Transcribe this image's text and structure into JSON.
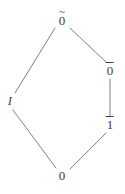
{
  "figure": {
    "kind": "hasse-diagram",
    "background_color": "#ffffff",
    "line_color": "#808080",
    "text_color": "#3d3d3d",
    "width": 125,
    "height": 194
  },
  "nodes": [
    {
      "id": "zero-tilde",
      "label": "0",
      "accent": "tilde",
      "accent_glyph": "~",
      "display": "0̃",
      "style": "roman",
      "x": 62,
      "y": 20
    },
    {
      "id": "zero-bar",
      "label": "0",
      "accent": "overline",
      "accent_glyph": "¯",
      "display": "0̄",
      "style": "roman",
      "x": 110,
      "y": 70
    },
    {
      "id": "i-node",
      "label": "I",
      "accent": "none",
      "accent_glyph": "",
      "display": "I",
      "style": "italic",
      "x": 10,
      "y": 101
    },
    {
      "id": "one-bar",
      "label": "1",
      "accent": "overline",
      "accent_glyph": "¯",
      "display": "1̄",
      "style": "roman",
      "x": 110,
      "y": 124
    },
    {
      "id": "zero-node",
      "label": "0",
      "accent": "none",
      "accent_glyph": "",
      "display": "0",
      "style": "roman",
      "x": 62,
      "y": 175
    }
  ],
  "edges": [
    {
      "id": "edge-zerotilde-i",
      "from": "zero-tilde",
      "to": "i-node",
      "x1": 55,
      "y1": 28,
      "x2": 15,
      "y2": 93
    },
    {
      "id": "edge-zerotilde-zerobar",
      "from": "zero-tilde",
      "to": "zero-bar",
      "x1": 70,
      "y1": 28,
      "x2": 106,
      "y2": 62
    },
    {
      "id": "edge-zerobar-onebar",
      "from": "zero-bar",
      "to": "one-bar",
      "x1": 110,
      "y1": 79,
      "x2": 110,
      "y2": 116
    },
    {
      "id": "edge-i-zero",
      "from": "i-node",
      "to": "zero-node",
      "x1": 13,
      "y1": 110,
      "x2": 56,
      "y2": 168
    },
    {
      "id": "edge-onebar-zero",
      "from": "one-bar",
      "to": "zero-node",
      "x1": 106,
      "y1": 133,
      "x2": 70,
      "y2": 169
    }
  ]
}
